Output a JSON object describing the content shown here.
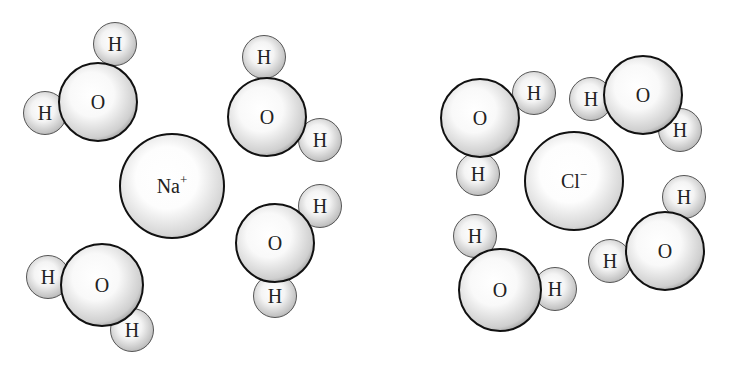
{
  "diagram": {
    "type": "ion hydration illustration",
    "left_group": {
      "ion": {
        "symbol": "Na",
        "charge": "+",
        "x": 172,
        "y": 186,
        "r": 53
      },
      "waters": [
        {
          "O": {
            "label": "O",
            "x": 98,
            "y": 102,
            "r": 40
          },
          "H1": {
            "label": "H",
            "x": 115,
            "y": 44,
            "r": 22
          },
          "H2": {
            "label": "H",
            "x": 45,
            "y": 113,
            "r": 22
          }
        },
        {
          "O": {
            "label": "O",
            "x": 267,
            "y": 117,
            "r": 40
          },
          "H1": {
            "label": "H",
            "x": 264,
            "y": 57,
            "r": 22
          },
          "H2": {
            "label": "H",
            "x": 320,
            "y": 140,
            "r": 22
          }
        },
        {
          "O": {
            "label": "O",
            "x": 275,
            "y": 243,
            "r": 40
          },
          "H1": {
            "label": "H",
            "x": 320,
            "y": 206,
            "r": 22
          },
          "H2": {
            "label": "H",
            "x": 275,
            "y": 296,
            "r": 22
          }
        },
        {
          "O": {
            "label": "O",
            "x": 102,
            "y": 285,
            "r": 42
          },
          "H1": {
            "label": "H",
            "x": 48,
            "y": 277,
            "r": 22
          },
          "H2": {
            "label": "H",
            "x": 132,
            "y": 330,
            "r": 22
          }
        }
      ]
    },
    "right_group": {
      "ion": {
        "symbol": "Cl",
        "charge": "−",
        "x": 574,
        "y": 181,
        "r": 50
      },
      "waters": [
        {
          "O": {
            "label": "O",
            "x": 480,
            "y": 118,
            "r": 40
          },
          "H1": {
            "label": "H",
            "x": 534,
            "y": 93,
            "r": 22
          },
          "H2": {
            "label": "H",
            "x": 478,
            "y": 174,
            "r": 22
          }
        },
        {
          "O": {
            "label": "O",
            "x": 643,
            "y": 95,
            "r": 40
          },
          "H1": {
            "label": "H",
            "x": 591,
            "y": 99,
            "r": 22
          },
          "H2": {
            "label": "H",
            "x": 680,
            "y": 130,
            "r": 22
          }
        },
        {
          "O": {
            "label": "O",
            "x": 665,
            "y": 251,
            "r": 40
          },
          "H1": {
            "label": "H",
            "x": 684,
            "y": 197,
            "r": 22
          },
          "H2": {
            "label": "H",
            "x": 610,
            "y": 261,
            "r": 22
          }
        },
        {
          "O": {
            "label": "O",
            "x": 500,
            "y": 290,
            "r": 42
          },
          "H1": {
            "label": "H",
            "x": 475,
            "y": 236,
            "r": 22
          },
          "H2": {
            "label": "H",
            "x": 555,
            "y": 289,
            "r": 22
          }
        }
      ]
    }
  }
}
